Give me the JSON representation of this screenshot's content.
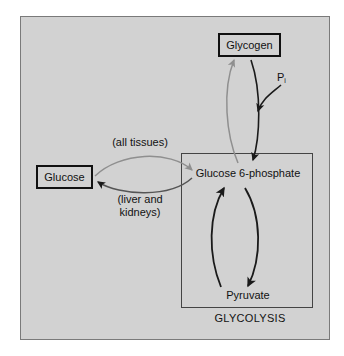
{
  "figure": {
    "background_color": "#d2d2d2",
    "nodes": {
      "glycogen": {
        "label": "Glycogen",
        "boxed": true
      },
      "glucose": {
        "label": "Glucose",
        "boxed": true
      },
      "g6p": {
        "label": "Glucose 6-phosphate",
        "boxed": false
      },
      "pyruvate": {
        "label": "Pyruvate",
        "boxed": false
      }
    },
    "compartment": {
      "label": "GLYCOLYSIS"
    },
    "annotations": {
      "all_tissues": "(all tissues)",
      "liver_kidneys_line1": "(liver and",
      "liver_kidneys_line2": "kidneys)",
      "phosphate_symbol": "P",
      "phosphate_subscript": "i"
    },
    "colors": {
      "arrow_dark": "#1a1a1a",
      "arrow_light": "#8f8f8f",
      "box_border": "#111111",
      "frame_border": "#7a7a7a",
      "compartment_border": "#444444",
      "text": "#111111"
    }
  }
}
